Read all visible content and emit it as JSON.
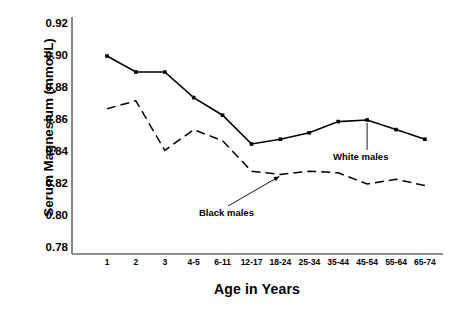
{
  "chart_data": {
    "type": "line",
    "title": "",
    "xlabel": "Age in Years",
    "ylabel": "Serum Magnesium (mmol/L)",
    "categories": [
      "1",
      "2",
      "3",
      "4-5",
      "6-11",
      "12-17",
      "18-24",
      "25-34",
      "35-44",
      "45-54",
      "55-64",
      "65-74"
    ],
    "ylim": [
      0.78,
      0.92
    ],
    "yticks": [
      "0.92",
      "0.90",
      "0.88",
      "0.86",
      "0.84",
      "0.82",
      "0.80",
      "0.78"
    ],
    "ytick_values": [
      0.92,
      0.9,
      0.88,
      0.86,
      0.84,
      0.82,
      0.8,
      0.78
    ],
    "grid": false,
    "legend_position": "inline-annotations",
    "series": [
      {
        "name": "White males",
        "style": "solid",
        "marker": "filled-square",
        "color": "#000000",
        "values": [
          0.9,
          0.89,
          0.89,
          0.874,
          0.863,
          0.845,
          0.848,
          0.852,
          0.859,
          0.86,
          0.854,
          0.848
        ]
      },
      {
        "name": "Black males",
        "style": "dashed",
        "marker": "none",
        "color": "#000000",
        "values": [
          0.867,
          0.872,
          0.841,
          0.854,
          0.847,
          0.828,
          0.826,
          0.828,
          0.827,
          0.82,
          0.823,
          0.819
        ]
      }
    ],
    "annotations": [
      {
        "text": "White males",
        "target_series": "White males",
        "target_category": "45-54"
      },
      {
        "text": "Black males",
        "target_series": "Black males",
        "target_category": "18-24"
      }
    ]
  },
  "axes": {
    "y_title": "Serum Magnesium (mmol/L)",
    "x_title": "Age in Years"
  }
}
